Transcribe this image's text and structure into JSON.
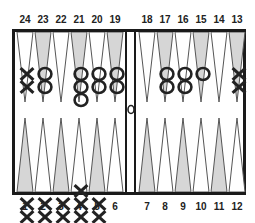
{
  "board": {
    "title": "Backgammon board",
    "colors": {
      "frame": "#1a1a1a",
      "shaded_point": "#d6d6d6",
      "white_point": "#ffffff",
      "outline": "#555555",
      "checker_ink": "#222222"
    },
    "top_left_labels": [
      "24",
      "23",
      "22",
      "21",
      "20",
      "19"
    ],
    "top_right_labels": [
      "18",
      "17",
      "16",
      "15",
      "14",
      "13"
    ],
    "bottom_left_labels": [
      "1",
      "2",
      "3",
      "4",
      "5",
      "6"
    ],
    "bottom_right_labels": [
      "7",
      "8",
      "9",
      "10",
      "11",
      "12"
    ],
    "points": [
      {
        "number": "24",
        "shaded": false,
        "checker": "X",
        "count": 2
      },
      {
        "number": "23",
        "shaded": true,
        "checker": "O",
        "count": 2
      },
      {
        "number": "22",
        "shaded": false,
        "checker": "",
        "count": 0
      },
      {
        "number": "21",
        "shaded": true,
        "checker": "O",
        "count": 3
      },
      {
        "number": "20",
        "shaded": false,
        "checker": "O",
        "count": 2
      },
      {
        "number": "19",
        "shaded": true,
        "checker": "O",
        "count": 2
      },
      {
        "number": "18",
        "shaded": false,
        "checker": "",
        "count": 0
      },
      {
        "number": "17",
        "shaded": true,
        "checker": "O",
        "count": 2
      },
      {
        "number": "16",
        "shaded": false,
        "checker": "O",
        "count": 2
      },
      {
        "number": "15",
        "shaded": true,
        "checker": "O",
        "count": 1
      },
      {
        "number": "14",
        "shaded": false,
        "checker": "",
        "count": 0
      },
      {
        "number": "13",
        "shaded": true,
        "checker": "X",
        "count": 2
      },
      {
        "number": "1",
        "shaded": true,
        "checker": "X",
        "count": 2
      },
      {
        "number": "2",
        "shaded": false,
        "checker": "X",
        "count": 2
      },
      {
        "number": "3",
        "shaded": true,
        "checker": "X",
        "count": 2
      },
      {
        "number": "4",
        "shaded": false,
        "checker": "X",
        "count": 3
      },
      {
        "number": "5",
        "shaded": true,
        "checker": "X",
        "count": 2
      },
      {
        "number": "6",
        "shaded": false,
        "checker": "",
        "count": 0
      },
      {
        "number": "7",
        "shaded": true,
        "checker": "",
        "count": 0
      },
      {
        "number": "8",
        "shaded": false,
        "checker": "",
        "count": 0
      },
      {
        "number": "9",
        "shaded": true,
        "checker": "",
        "count": 0
      },
      {
        "number": "10",
        "shaded": false,
        "checker": "",
        "count": 0
      },
      {
        "number": "11",
        "shaded": true,
        "checker": "",
        "count": 0
      },
      {
        "number": "12",
        "shaded": false,
        "checker": "",
        "count": 0
      }
    ],
    "bar": {
      "checker": "O",
      "count": 1
    }
  }
}
